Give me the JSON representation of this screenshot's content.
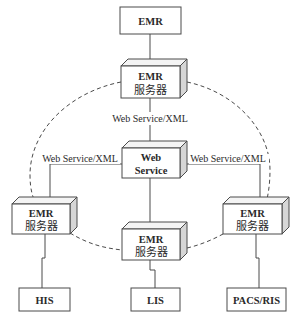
{
  "diagram": {
    "nodes": {
      "emr_client": {
        "label": "EMR"
      },
      "server_top": {
        "line1": "EMR",
        "line2": "服务器"
      },
      "web_service": {
        "line1": "Web",
        "line2": "Service"
      },
      "server_left": {
        "line1": "EMR",
        "line2": "服务器"
      },
      "server_right": {
        "line1": "EMR",
        "line2": "服务器"
      },
      "server_bottom": {
        "line1": "EMR",
        "line2": "服务器"
      },
      "his": {
        "label": "HIS"
      },
      "lis": {
        "label": "LIS"
      },
      "pacs_ris": {
        "label": "PACS/RIS"
      }
    },
    "edges": {
      "top_to_ws": {
        "label": "Web Service/XML"
      },
      "left_to_ws": {
        "label": "Web Service/XML"
      },
      "right_to_ws": {
        "label": "Web Service/XML"
      }
    },
    "ring": {
      "style": "dashed",
      "connects": [
        "server_top",
        "server_right",
        "server_bottom",
        "server_left"
      ]
    },
    "colors": {
      "line": "#4a4a4a",
      "box_front": "#ffffff",
      "box_side": "#d6d6d6",
      "box_top": "#f4f4f4"
    }
  }
}
